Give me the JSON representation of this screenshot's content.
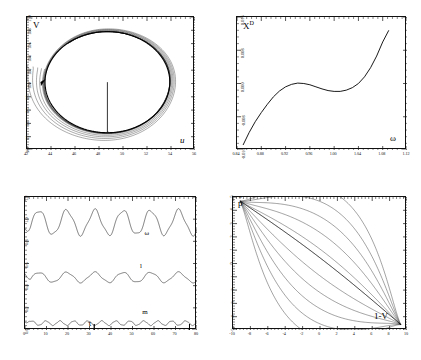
{
  "figure": {
    "title": "",
    "panel_count": 4,
    "background": "#ffffff",
    "line_color": "#111111"
  },
  "chart_data": [
    {
      "id": "panel-top-left",
      "type": "line",
      "title": "",
      "xlabel": "u",
      "ylabel": "V",
      "xlim": [
        42,
        56
      ],
      "ylim": [
        90,
        110
      ],
      "xticks": [
        "42",
        "44",
        "46",
        "48",
        "50",
        "52",
        "54",
        "56"
      ],
      "yticks": [
        "90",
        "92",
        "94",
        "96",
        "98",
        "100",
        "102",
        "104",
        "106",
        "108",
        "110"
      ],
      "grid": false,
      "legend": "none",
      "annotations": [
        {
          "text": "arrow",
          "x": 43.3,
          "y": 100.2,
          "name": "direction-arrow"
        }
      ],
      "description": "Spiralling trajectory converging onto a closed limit cycle in the (u,V) phase plane, with a vertical line segment from the centre down to the lower cycle boundary.",
      "center": [
        48.7,
        100.2
      ],
      "cycle_rx": 5.2,
      "cycle_ry": 7.6,
      "spiral_turns": 4,
      "marker_line": {
        "x": 48.7,
        "y_top": 100.2,
        "y_bottom": 92.7
      }
    },
    {
      "id": "panel-top-right",
      "type": "line",
      "title": "",
      "xlabel": "ω",
      "ylabel": "X^D",
      "xlim": [
        0.84,
        1.12
      ],
      "ylim": [
        -0.016,
        0.016
      ],
      "xticks": [
        "0.84",
        "0.88",
        "0.92",
        "0.96",
        "1.00",
        "1.04",
        "1.08",
        "1.12"
      ],
      "yticks": [
        "-0.016",
        "-0.008",
        "0.000",
        "0.008",
        "0.016"
      ],
      "grid": false,
      "legend": "none",
      "description": "Single S-shaped (cubic-like) response curve rising from lower left, local maximum near ω=0.94, local minimum near ω=1.01, then rising steeply to upper right.",
      "x": [
        0.85,
        0.86,
        0.87,
        0.88,
        0.89,
        0.9,
        0.91,
        0.92,
        0.93,
        0.94,
        0.95,
        0.96,
        0.97,
        0.98,
        0.99,
        1.0,
        1.01,
        1.02,
        1.03,
        1.04,
        1.05,
        1.06,
        1.07,
        1.08,
        1.09
      ],
      "values": [
        -0.0148,
        -0.0118,
        -0.0092,
        -0.007,
        -0.005,
        -0.0032,
        -0.0018,
        -0.0008,
        -0.0002,
        0.0001,
        0.0,
        -0.0003,
        -0.0008,
        -0.0013,
        -0.0017,
        -0.0019,
        -0.0019,
        -0.0016,
        -0.001,
        0.0,
        0.0016,
        0.0038,
        0.0066,
        0.01,
        0.0128
      ]
    },
    {
      "id": "panel-bottom-left",
      "type": "line",
      "title": "",
      "xlabel": "τ",
      "ylabel": "",
      "xlim": [
        0,
        80
      ],
      "ylim": [
        0.0,
        1.2
      ],
      "xticks": [
        "0",
        "10",
        "20",
        "30",
        "40",
        "50",
        "60",
        "70",
        "80"
      ],
      "yticks": [
        "0.0",
        "0.2",
        "0.4",
        "0.6",
        "0.8",
        "1.0",
        "1.2"
      ],
      "grid": false,
      "legend": "inline-curve-labels",
      "description": "Three quasi-periodic oscillating time series plotted against τ; top curve ω oscillates about 0.97, middle curve l about 0.48, bottom curve m about 0.06.",
      "series": [
        {
          "name": "ω",
          "mean": 0.97,
          "amplitude": 0.11,
          "period": 13.0,
          "label_x": 56,
          "label_y": 0.855
        },
        {
          "name": "l",
          "mean": 0.475,
          "amplitude": 0.045,
          "period": 13.0,
          "label_x": 54,
          "label_y": 0.555
        },
        {
          "name": "m",
          "mean": 0.062,
          "amplitude": 0.02,
          "period": 6.5,
          "label_x": 55,
          "label_y": 0.145
        }
      ]
    },
    {
      "id": "panel-bottom-right",
      "type": "line",
      "title": "",
      "xlabel": "1-V",
      "ylabel": "p̂",
      "xlim": [
        -10,
        10
      ],
      "ylim": [
        -5,
        5
      ],
      "xticks": [
        "-10",
        "-8",
        "-6",
        "-4",
        "-2",
        "0",
        "2",
        "4",
        "6",
        "8",
        "10"
      ],
      "yticks": [
        "-5",
        "-4",
        "-3",
        "-2",
        "-1",
        "0",
        "1",
        "2",
        "3",
        "4",
        "5"
      ],
      "grid": false,
      "legend": "none",
      "description": "Narrow lens / eye-shaped closed orbits, elongated along the anti-diagonal from upper-left (-9,4.6) to lower-right (9,-4.4), composed of several nested loops.",
      "loops": 5,
      "extent": {
        "x_min": -9.2,
        "x_max": 9.3,
        "y_min": -4.6,
        "y_max": 4.7
      }
    }
  ],
  "labels": {
    "panel1_y": "V",
    "panel1_x": "u",
    "panel2_y_base": "X",
    "panel2_y_sup": "D",
    "panel2_x": "ω",
    "panel3_x": "τ",
    "panel3_curve_omega": "ω",
    "panel3_curve_l": "l",
    "panel3_curve_m": "m",
    "panel4_y": "p",
    "panel4_y_hat": "ˆ",
    "panel4_x": "1-V"
  }
}
